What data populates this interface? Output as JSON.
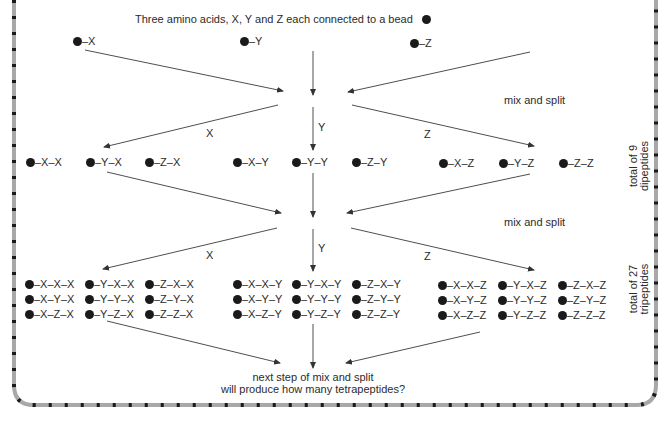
{
  "header": {
    "intro": "Three amino acids, X, Y and Z each connected to a bead"
  },
  "monomers": [
    "–X",
    "–Y",
    "–Z"
  ],
  "steps": {
    "step1_label": "mix and split",
    "step2_label": "mix and split",
    "branch_labels_1": [
      "X",
      "Y",
      "Z"
    ],
    "branch_labels_2": [
      "X",
      "Y",
      "Z"
    ]
  },
  "dipeptides": {
    "x_group": [
      "–X–X",
      "–Y–X",
      "–Z–X"
    ],
    "y_group": [
      "–X–Y",
      "–Y–Y",
      "–Z–Y"
    ],
    "z_group": [
      "–X–Z",
      "–Y–Z",
      "–Z–Z"
    ],
    "total_line1": "total of 9",
    "total_line2": "dipeptides"
  },
  "tripeptides": {
    "x_group": {
      "col1": [
        "–X–X–X",
        "–X–Y–X",
        "–X–Z–X"
      ],
      "col2": [
        "–Y–X–X",
        "–Y–Y–X",
        "–Y–Z–X"
      ],
      "col3": [
        "–Z–X–X",
        "–Z–Y–X",
        "–Z–Z–X"
      ]
    },
    "y_group": {
      "col1": [
        "–X–X–Y",
        "–X–Y–Y",
        "–X–Z–Y"
      ],
      "col2": [
        "–Y–X–Y",
        "–Y–Y–Y",
        "–Y–Z–Y"
      ],
      "col3": [
        "–Z–X–Y",
        "–Z–Y–Y",
        "–Z–Z–Y"
      ]
    },
    "z_group": {
      "col1": [
        "–X–X–Z",
        "–X–Y–Z",
        "–X–Z–Z"
      ],
      "col2": [
        "–Y–X–Z",
        "–Y–Y–Z",
        "–Y–Z–Z"
      ],
      "col3": [
        "–Z–X–Z",
        "–Z–Y–Z",
        "–Z–Z–Z"
      ]
    },
    "total_line1": "total of 27",
    "total_line2": "tripeptides"
  },
  "footer": {
    "line1": "next step of mix and split",
    "line2": "will produce how many tetrapeptides?"
  },
  "colors": {
    "border_gray": "#a8a8a8",
    "border_dash": "#1a1a1a",
    "line": "#3a3a3a",
    "bead": "#1a1a1a"
  }
}
